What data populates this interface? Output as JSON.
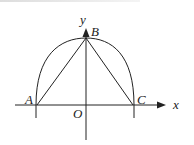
{
  "diagram": {
    "labels": {
      "y_axis": "y",
      "x_axis": "x",
      "origin": "O",
      "point_a": "A",
      "point_b": "B",
      "point_c": "C"
    },
    "colors": {
      "stroke": "#222222",
      "background": "#ffffff"
    }
  }
}
